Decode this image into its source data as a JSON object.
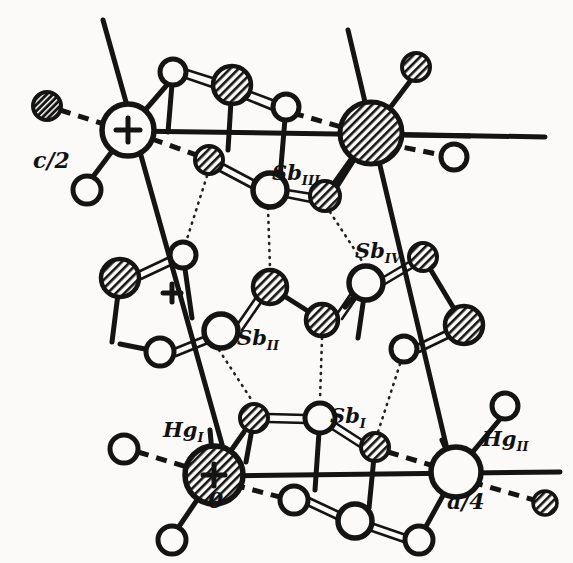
{
  "figure": {
    "domain": "Diagram",
    "kind": "crystal-structure-projection",
    "background_color": "#fbfaf8",
    "ink_color": "#111111",
    "description_labels": [
      "c/2",
      "Sb_III",
      "Sb_IV",
      "Sb_II",
      "Sb_I",
      "Hg_I",
      "Hg_II",
      "0",
      "a/4"
    ]
  },
  "labels": {
    "c_half": {
      "text": "c/2",
      "x": 33,
      "y": 168
    },
    "sb3": {
      "base": "Sb",
      "sub": "III",
      "x": 272,
      "y": 180
    },
    "sb4": {
      "base": "Sb",
      "sub": "IV",
      "x": 355,
      "y": 258
    },
    "sb2": {
      "base": "Sb",
      "sub": "II",
      "x": 237,
      "y": 345
    },
    "sb1": {
      "base": "Sb",
      "sub": "I",
      "x": 330,
      "y": 423
    },
    "hg1": {
      "base": "Hg",
      "sub": "I",
      "x": 163,
      "y": 437
    },
    "hg2": {
      "base": "Hg",
      "sub": "II",
      "x": 482,
      "y": 446
    },
    "origin": {
      "text": "0",
      "x": 208,
      "y": 508
    },
    "a_quarter": {
      "text": "a/4",
      "x": 447,
      "y": 509
    }
  },
  "markers": {
    "plus_top": {
      "name": "plus-in-circle-top",
      "x": 128,
      "y": 130
    },
    "plus_mid": {
      "name": "plus-standalone-middle",
      "x": 172,
      "y": 293
    },
    "plus_bottom": {
      "name": "plus-in-circle-bottom",
      "x": 214,
      "y": 475
    }
  },
  "atoms": {
    "legend": {
      "open": "open circle (light atom / upper layer)",
      "hatched": "hatched circle (atom at different height)",
      "dark": "dark hatched small circle"
    },
    "open_circles": [
      {
        "id": "o1",
        "x": 173,
        "y": 72,
        "r": 13
      },
      {
        "id": "o2",
        "x": 286,
        "y": 107,
        "r": 13
      },
      {
        "id": "o3",
        "x": 454,
        "y": 157,
        "r": 13
      },
      {
        "id": "o4",
        "x": 87,
        "y": 190,
        "r": 14
      },
      {
        "id": "o5",
        "x": 270,
        "y": 190,
        "r": 17
      },
      {
        "id": "o6",
        "x": 183,
        "y": 255,
        "r": 13
      },
      {
        "id": "o7",
        "x": 366,
        "y": 283,
        "r": 17
      },
      {
        "id": "o8",
        "x": 221,
        "y": 331,
        "r": 17
      },
      {
        "id": "o9",
        "x": 160,
        "y": 352,
        "r": 14
      },
      {
        "id": "o10",
        "x": 404,
        "y": 349,
        "r": 13
      },
      {
        "id": "o11",
        "x": 320,
        "y": 418,
        "r": 15
      },
      {
        "id": "o12",
        "x": 124,
        "y": 449,
        "r": 14
      },
      {
        "id": "o13",
        "x": 505,
        "y": 406,
        "r": 13
      },
      {
        "id": "o14",
        "x": 456,
        "y": 472,
        "r": 25
      },
      {
        "id": "o15",
        "x": 294,
        "y": 500,
        "r": 14
      },
      {
        "id": "o16",
        "x": 355,
        "y": 521,
        "r": 17
      },
      {
        "id": "o17",
        "x": 419,
        "y": 540,
        "r": 14
      },
      {
        "id": "o18",
        "x": 172,
        "y": 540,
        "r": 14
      },
      {
        "id": "o19",
        "x": 128,
        "y": 130,
        "r": 26
      }
    ],
    "hatched_circles": [
      {
        "id": "h1",
        "x": 232,
        "y": 85,
        "r": 19
      },
      {
        "id": "h2",
        "x": 416,
        "y": 67,
        "r": 14
      },
      {
        "id": "h3",
        "x": 371,
        "y": 133,
        "r": 31
      },
      {
        "id": "h4",
        "x": 209,
        "y": 160,
        "r": 14
      },
      {
        "id": "h5",
        "x": 325,
        "y": 196,
        "r": 15
      },
      {
        "id": "h6",
        "x": 47,
        "y": 106,
        "r": 14
      },
      {
        "id": "h7",
        "x": 120,
        "y": 278,
        "r": 19
      },
      {
        "id": "h8",
        "x": 270,
        "y": 287,
        "r": 17
      },
      {
        "id": "h9",
        "x": 322,
        "y": 320,
        "r": 16
      },
      {
        "id": "h10",
        "x": 423,
        "y": 257,
        "r": 14
      },
      {
        "id": "h11",
        "x": 464,
        "y": 325,
        "r": 19
      },
      {
        "id": "h12",
        "x": 254,
        "y": 418,
        "r": 14
      },
      {
        "id": "h13",
        "x": 375,
        "y": 447,
        "r": 14
      },
      {
        "id": "h14",
        "x": 214,
        "y": 475,
        "r": 29
      },
      {
        "id": "h15",
        "x": 545,
        "y": 503,
        "r": 12
      }
    ]
  },
  "bonds": {
    "solid_count": 32,
    "double_count": 14,
    "dashed_count": 6,
    "dotted_count": 8
  }
}
